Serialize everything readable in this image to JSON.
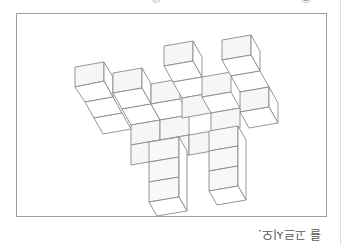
{
  "orientation": "rotated-180",
  "choices_cut_off": [
    {
      "label": "④",
      "position": "top-center"
    },
    {
      "label": "⑤",
      "position": "top-right"
    }
  ],
  "figure": {
    "line_color": "#8a8a8a",
    "face_color": "#ffffff",
    "shade_color": "#f4f4f4"
  },
  "question": {
    "text_fragment": "를 고르시오."
  }
}
